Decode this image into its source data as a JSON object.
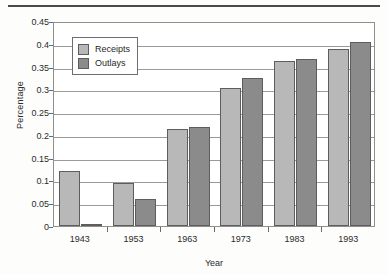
{
  "chart_data": {
    "type": "bar",
    "title": "",
    "xlabel": "Year",
    "ylabel": "Percentage",
    "categories": [
      "1943",
      "1953",
      "1963",
      "1973",
      "1983",
      "1993"
    ],
    "series": [
      {
        "name": "Receipts",
        "color": "#b8b8b8",
        "values": [
          0.12,
          0.094,
          0.212,
          0.302,
          0.362,
          0.389
        ]
      },
      {
        "name": "Outlays",
        "color": "#8b8b8b",
        "values": [
          0.002,
          0.06,
          0.217,
          0.326,
          0.367,
          0.405
        ]
      }
    ],
    "ylim": [
      0,
      0.45
    ],
    "ytick_labels": [
      "0",
      "0.05",
      "0.1",
      "0.15",
      "0.2",
      "0.25",
      "0.3",
      "0.35",
      "0.4",
      "0.45"
    ],
    "ytick_values": [
      0,
      0.05,
      0.1,
      0.15,
      0.2,
      0.25,
      0.3,
      0.35,
      0.4,
      0.45
    ],
    "grid": "horizontal",
    "legend_position": "top-left-inside",
    "legend_entries": [
      "Receipts",
      "Outlays"
    ]
  }
}
